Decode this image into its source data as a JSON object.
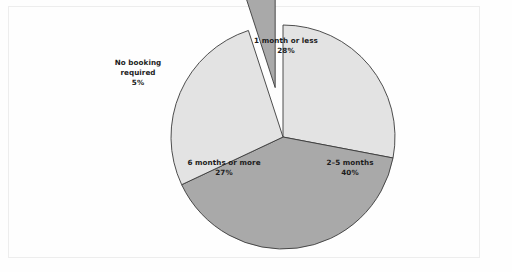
{
  "chart_data": {
    "type": "pie",
    "title": "",
    "subtitle": "",
    "xlabel": "",
    "ylabel": "",
    "legend_position": "none",
    "grid": false,
    "units": "percent",
    "start_angle_deg": 0,
    "direction": "clockwise",
    "categories": [
      "1 month or less",
      "2–5 months",
      "6 months or more",
      "No booking required"
    ],
    "values": [
      28,
      40,
      27,
      5
    ],
    "slices": [
      {
        "id": "one-month-or-less",
        "label": "1 month or less",
        "value": 28,
        "value_text": "28%",
        "color": "#e3e3e3",
        "exploded": false,
        "start_angle_deg": 0,
        "end_angle_deg": 100.8
      },
      {
        "id": "two-to-five-months",
        "label": "2–5 months",
        "value": 40,
        "value_text": "40%",
        "color": "#a9a9a9",
        "exploded": false,
        "start_angle_deg": 100.8,
        "end_angle_deg": 244.8
      },
      {
        "id": "six-months-or-more",
        "label": "6 months or more",
        "value": 27,
        "value_text": "27%",
        "color": "#e3e3e3",
        "exploded": false,
        "start_angle_deg": 244.8,
        "end_angle_deg": 342.0
      },
      {
        "id": "no-booking-required",
        "label_line1": "No booking",
        "label_line2": "required",
        "label": "No booking required",
        "value": 5,
        "value_text": "5%",
        "color": "#a9a9a9",
        "exploded": true,
        "start_angle_deg": 342.0,
        "end_angle_deg": 360.0
      }
    ],
    "colors": {
      "light_slice": "#e3e3e3",
      "dark_slice": "#a9a9a9",
      "outline": "#3a3a3a",
      "label_text": "#1c1c1c",
      "background": "#fefefe",
      "frame_border": "#ededed"
    },
    "geometry": {
      "center_x": 283,
      "center_y": 137,
      "radius": 112,
      "explode_offset": 50
    }
  }
}
